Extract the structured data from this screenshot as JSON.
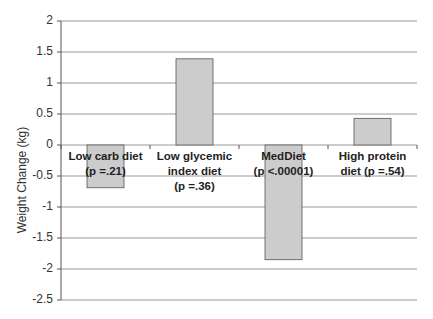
{
  "chart_data": {
    "type": "bar",
    "title": "",
    "xlabel": "",
    "ylabel": "Weight Change (kg)",
    "ylim": [
      -2.5,
      2
    ],
    "yticks": [
      2,
      1.5,
      1,
      0.5,
      0,
      -0.5,
      -1,
      -1.5,
      -2,
      -2.5
    ],
    "ytick_labels": [
      "2",
      "1.5",
      "1",
      "0.5",
      "0",
      "-0.5",
      "-1",
      "-1.5",
      "-2",
      "-2.5"
    ],
    "grid": true,
    "legend": null,
    "categories": [
      "Low carb diet (p =.21)",
      "Low glycemic index diet (p =.36)",
      "MedDiet (p <.00001)",
      "High protein diet (p =.54)"
    ],
    "category_label_lines": [
      [
        "Low carb diet",
        "(p =.21)"
      ],
      [
        "Low glycemic",
        "index diet",
        "(p =.36)"
      ],
      [
        "MedDiet",
        "(p <.00001)"
      ],
      [
        "High protein",
        "diet (p =.54)"
      ]
    ],
    "values": [
      -0.69,
      1.39,
      -1.85,
      0.43
    ],
    "bar_color": "#cccccc",
    "bar_edge_color": "#555555",
    "grid_color": "#999999"
  }
}
